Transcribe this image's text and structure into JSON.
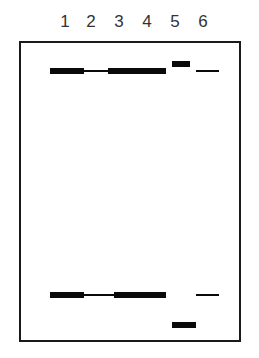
{
  "lanes": [
    {
      "label": "1",
      "x": 65
    },
    {
      "label": "2",
      "x": 91
    },
    {
      "label": "3",
      "x": 119
    },
    {
      "label": "4",
      "x": 147
    },
    {
      "label": "5",
      "x": 175
    },
    {
      "label": "6",
      "x": 203
    }
  ],
  "colors": {
    "band": "#0a0a0a",
    "border": "#1a1a1a",
    "label": "#333333",
    "background": "#ffffff"
  },
  "bands": [
    {
      "lane": "1",
      "position": "upper",
      "x": 50,
      "y": 68,
      "w": 34,
      "h": 6
    },
    {
      "lane": "2",
      "position": "upper",
      "x": 84,
      "y": 70,
      "w": 24,
      "h": 2
    },
    {
      "lane": "3-4",
      "position": "upper",
      "x": 108,
      "y": 68,
      "w": 58,
      "h": 6
    },
    {
      "lane": "5",
      "position": "upper",
      "x": 172,
      "y": 61,
      "w": 18,
      "h": 6
    },
    {
      "lane": "6",
      "position": "upper",
      "x": 196,
      "y": 70,
      "w": 23,
      "h": 2
    },
    {
      "lane": "1",
      "position": "lower",
      "x": 50,
      "y": 292,
      "w": 34,
      "h": 6
    },
    {
      "lane": "2",
      "position": "lower",
      "x": 84,
      "y": 294,
      "w": 30,
      "h": 2
    },
    {
      "lane": "3-4",
      "position": "lower",
      "x": 114,
      "y": 292,
      "w": 52,
      "h": 6
    },
    {
      "lane": "6",
      "position": "lower",
      "x": 196,
      "y": 294,
      "w": 23,
      "h": 2
    },
    {
      "lane": "5",
      "position": "lower",
      "x": 172,
      "y": 322,
      "w": 24,
      "h": 6
    }
  ]
}
